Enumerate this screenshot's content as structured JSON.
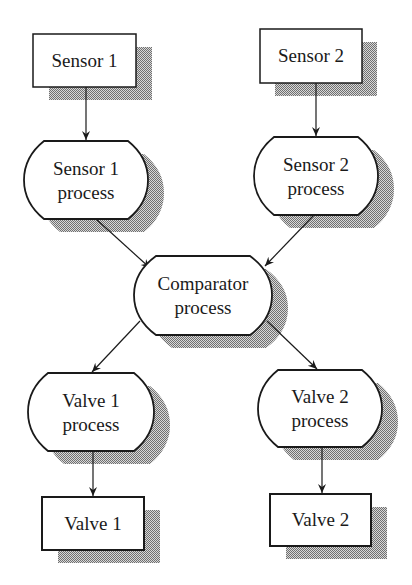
{
  "diagram": {
    "nodes": {
      "sensor1": {
        "label": "Sensor 1",
        "shape": "rectangle"
      },
      "sensor2": {
        "label": "Sensor 2",
        "shape": "rectangle"
      },
      "sensor1_process": {
        "line1": "Sensor 1",
        "line2": "process",
        "shape": "rounded-octagon"
      },
      "sensor2_process": {
        "line1": "Sensor 2",
        "line2": "process",
        "shape": "rounded-octagon"
      },
      "comparator": {
        "line1": "Comparator",
        "line2": "process",
        "shape": "rounded-octagon"
      },
      "valve1_process": {
        "line1": "Valve 1",
        "line2": "process",
        "shape": "rounded-octagon"
      },
      "valve2_process": {
        "line1": "Valve 2",
        "line2": "process",
        "shape": "rounded-octagon"
      },
      "valve1": {
        "label": "Valve 1",
        "shape": "rectangle"
      },
      "valve2": {
        "label": "Valve 2",
        "shape": "rectangle"
      }
    },
    "edges": [
      {
        "from": "Sensor 1",
        "to": "Sensor 1 process"
      },
      {
        "from": "Sensor 2",
        "to": "Sensor 2 process"
      },
      {
        "from": "Sensor 1 process",
        "to": "Comparator process"
      },
      {
        "from": "Sensor 2 process",
        "to": "Comparator process"
      },
      {
        "from": "Comparator process",
        "to": "Valve 1 process"
      },
      {
        "from": "Comparator process",
        "to": "Valve 2 process"
      },
      {
        "from": "Valve 1 process",
        "to": "Valve 1"
      },
      {
        "from": "Valve 2 process",
        "to": "Valve 2"
      }
    ],
    "colors": {
      "stroke": "#1a1a1a",
      "shadow": "#8c8c8c",
      "background": "#ffffff"
    }
  }
}
